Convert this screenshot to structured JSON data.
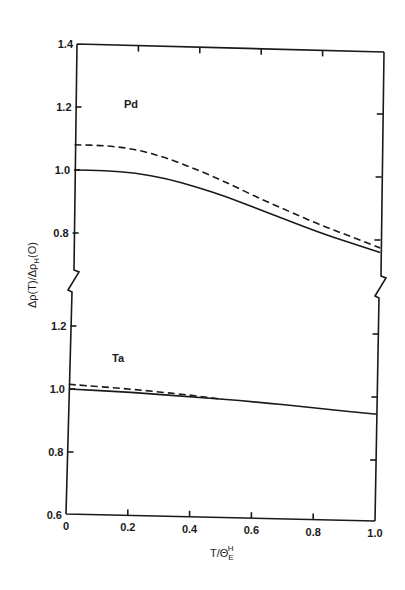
{
  "chart_data": {
    "type": "line",
    "title": "",
    "xlabel": "T/Θ_E^H",
    "xlabel_parts": {
      "main": "T/Θ",
      "sub": "E",
      "sup": "H"
    },
    "ylabel": "Δρ(T)/Δρ_H(O)",
    "ylabel_parts": {
      "pre": "Δρ(T)/Δρ",
      "sub": "H",
      "post": "(O)"
    },
    "xlim": [
      0,
      1.0
    ],
    "x_ticks": [
      0,
      0.2,
      0.4,
      0.6,
      0.8,
      1.0
    ],
    "x_tick_labels": [
      "0",
      "0.2",
      "0.4",
      "0.6",
      "0.8",
      "1.0"
    ],
    "grid": false,
    "legend": "none",
    "broken_y_axis": true,
    "panels": [
      {
        "name": "Pd",
        "label": "Pd",
        "ylim": [
          0.7,
          1.4
        ],
        "y_ticks": [
          0.8,
          1.0,
          1.2,
          1.4
        ],
        "y_tick_labels": [
          "0.8",
          "1.0",
          "1.2",
          "1.4"
        ],
        "series": [
          {
            "name": "Pd solid",
            "style": "solid",
            "x": [
              0,
              0.1,
              0.2,
              0.3,
              0.4,
              0.5,
              0.6,
              0.7,
              0.8,
              0.9,
              1.0
            ],
            "y": [
              1.0,
              1.0,
              0.995,
              0.98,
              0.955,
              0.925,
              0.89,
              0.855,
              0.82,
              0.79,
              0.76
            ]
          },
          {
            "name": "Pd dashed",
            "style": "dashed",
            "x": [
              0,
              0.1,
              0.2,
              0.3,
              0.4,
              0.5,
              0.6,
              0.7,
              0.8,
              0.9,
              1.0
            ],
            "y": [
              1.08,
              1.08,
              1.07,
              1.045,
              1.01,
              0.97,
              0.925,
              0.885,
              0.845,
              0.81,
              0.775
            ]
          }
        ]
      },
      {
        "name": "Ta",
        "label": "Ta",
        "ylim": [
          0.6,
          1.3
        ],
        "y_ticks": [
          0.6,
          0.8,
          1.0,
          1.2
        ],
        "y_tick_labels": [
          "0.6",
          "0.8",
          "1.0",
          "1.2"
        ],
        "series": [
          {
            "name": "Ta solid",
            "style": "solid",
            "x": [
              0,
              0.2,
              0.4,
              0.6,
              0.8,
              1.0
            ],
            "y": [
              1.0,
              0.995,
              0.985,
              0.975,
              0.96,
              0.945
            ]
          },
          {
            "name": "Ta dashed",
            "style": "dashed",
            "x": [
              0,
              0.2,
              0.4,
              0.5
            ],
            "y": [
              1.015,
              1.005,
              0.99,
              0.98
            ]
          }
        ]
      }
    ]
  }
}
